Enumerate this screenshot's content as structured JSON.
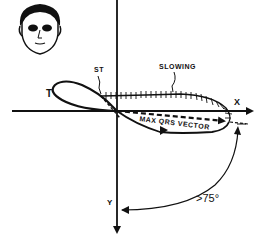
{
  "diagram": {
    "labels": {
      "t_wave": "T",
      "st_segment": "ST",
      "slowing": "SLOWING",
      "max_qrs_vector": "MAX QRS VECTOR",
      "x_axis": "X",
      "y_axis": "Y",
      "angle": ">75°"
    },
    "icons": {
      "patient_face": "face-icon"
    },
    "colors": {
      "stroke": "#111111",
      "background": "#ffffff"
    }
  }
}
